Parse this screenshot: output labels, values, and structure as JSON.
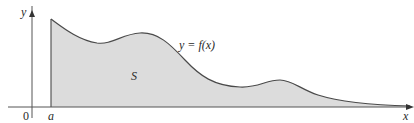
{
  "diagram": {
    "curve_label": "y = f(x)",
    "region_label": "S",
    "axis_labels": {
      "x": "x",
      "y": "y"
    },
    "tick_labels": {
      "origin": "0",
      "a": "a"
    },
    "colors": {
      "fill": "#dcdcdc",
      "curve": "#4a4a4a",
      "axis": "#555555",
      "text": "#2a2a2a"
    },
    "curve_points_px": [
      [
        51,
        19
      ],
      [
        70,
        33
      ],
      [
        90,
        42
      ],
      [
        105,
        43
      ],
      [
        120,
        38
      ],
      [
        135,
        33
      ],
      [
        150,
        33
      ],
      [
        165,
        40
      ],
      [
        180,
        55
      ],
      [
        200,
        72
      ],
      [
        220,
        84
      ],
      [
        240,
        87
      ],
      [
        258,
        84
      ],
      [
        275,
        79
      ],
      [
        290,
        81
      ],
      [
        305,
        90
      ],
      [
        325,
        97
      ],
      [
        350,
        102
      ],
      [
        380,
        105
      ],
      [
        410,
        106
      ]
    ]
  }
}
